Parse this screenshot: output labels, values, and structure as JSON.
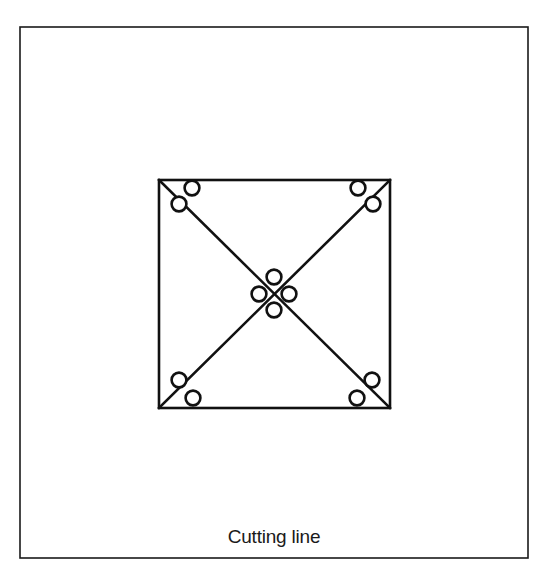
{
  "figure": {
    "caption": "Cutting line",
    "colors": {
      "background": "#ffffff",
      "stroke": "#111111",
      "frame_stroke": "#1a1a1a",
      "circle_fill": "#ffffff",
      "text": "#1a1a1a"
    },
    "outer_frame": {
      "name": "outer-frame",
      "x": 20,
      "y": 27,
      "width": 508,
      "height": 531,
      "stroke_width": 1.6
    },
    "square": {
      "name": "cutting-square",
      "x": 159,
      "y": 180,
      "width": 231,
      "height": 228,
      "stroke_width": 2.6
    },
    "diagonals": [
      {
        "name": "diagonal-top-left-to-bottom-right",
        "x1": 159,
        "y1": 180,
        "x2": 390,
        "y2": 408
      },
      {
        "name": "diagonal-bottom-left-to-top-right",
        "x1": 159,
        "y1": 408,
        "x2": 390,
        "y2": 180
      }
    ],
    "circle_style": {
      "radius": 7.4,
      "stroke_width": 2.6
    },
    "circles": [
      {
        "name": "circle-top-left-upper",
        "cx": 192,
        "cy": 188
      },
      {
        "name": "circle-top-left-lower",
        "cx": 179,
        "cy": 204
      },
      {
        "name": "circle-top-right-upper",
        "cx": 358,
        "cy": 188
      },
      {
        "name": "circle-top-right-lower",
        "cx": 373,
        "cy": 204
      },
      {
        "name": "circle-bottom-left-upper",
        "cx": 179,
        "cy": 380
      },
      {
        "name": "circle-bottom-left-lower",
        "cx": 193,
        "cy": 398
      },
      {
        "name": "circle-bottom-right-upper",
        "cx": 372,
        "cy": 380
      },
      {
        "name": "circle-bottom-right-lower",
        "cx": 357,
        "cy": 398
      },
      {
        "name": "circle-center-top",
        "cx": 274,
        "cy": 277
      },
      {
        "name": "circle-center-left",
        "cx": 259,
        "cy": 294
      },
      {
        "name": "circle-center-right",
        "cx": 289,
        "cy": 294
      },
      {
        "name": "circle-center-bottom",
        "cx": 274,
        "cy": 310
      }
    ],
    "caption_position": {
      "x": 274,
      "y": 543
    }
  }
}
